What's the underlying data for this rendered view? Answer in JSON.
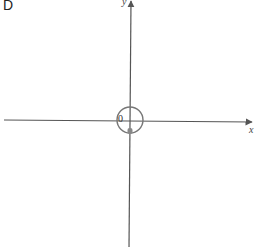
{
  "panel": {
    "label": "D"
  },
  "axes": {
    "x_label": "x",
    "y_label": "y",
    "origin_label": "0",
    "color": "#555555"
  },
  "circle": {
    "center": [
      0,
      0
    ],
    "radius_px": 13,
    "color": "#777777"
  },
  "marker": {
    "shape": "filled-rounded-rect",
    "position": "just below origin on y-axis",
    "color": "#888888"
  }
}
